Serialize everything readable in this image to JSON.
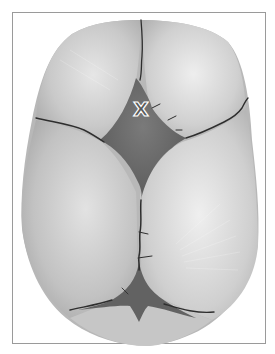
{
  "figure": {
    "label": "X",
    "colors": {
      "frame": "#9a9a9a",
      "bone_light": "#e4e4e4",
      "bone_mid": "#bdbdbd",
      "bone_dark": "#9e9e9e",
      "fontanelle": "#6e6e6e",
      "suture": "#2e2e2e",
      "label_outline": "#ffffff"
    }
  }
}
